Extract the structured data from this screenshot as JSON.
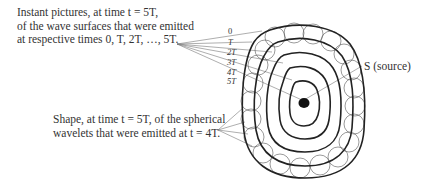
{
  "top_caption": {
    "line1": "Instant pictures, at time t = 5T,",
    "line2": "of the wave surfaces that were emitted",
    "line3": "at respective times 0, T, 2T, …, 5T."
  },
  "bottom_caption": {
    "line1": "Shape, at time t = 5T, of the spherical",
    "line2": "wavelets that were emitted at t = 4T."
  },
  "surface_labels": [
    "0",
    "T",
    "2T",
    "3T",
    "4T",
    "5T"
  ],
  "source_label": "S (source)",
  "colors": {
    "ink": "#222222",
    "text": "#333333",
    "leader": "#777777",
    "background": "#ffffff"
  }
}
